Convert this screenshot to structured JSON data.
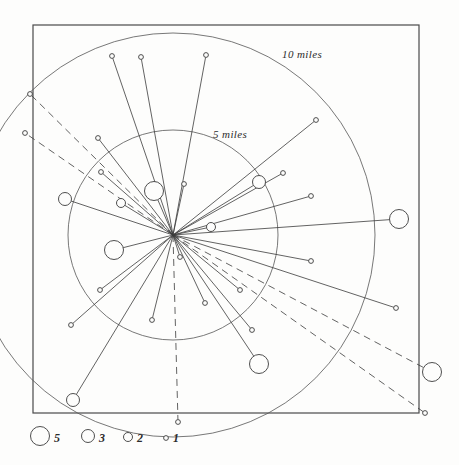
{
  "figure": {
    "background_color": "#fdfdfc",
    "ink_color": "#3b3b3b",
    "frame": {
      "x": 33,
      "y": 25,
      "width": 386,
      "height": 388
    }
  },
  "rings": [
    {
      "label": "5 miles",
      "radius_px": 105,
      "label_x": 213,
      "label_y": 138
    },
    {
      "label": "10 miles",
      "radius_px": 202,
      "label_x": 282,
      "label_y": 58
    }
  ],
  "legend": {
    "items": [
      {
        "value": "5",
        "radius_px": 9.5,
        "cx": 40,
        "cy": 436,
        "label_x": 54,
        "label_y": 442
      },
      {
        "value": "3",
        "radius_px": 6.5,
        "cx": 88,
        "cy": 436,
        "label_x": 99,
        "label_y": 442
      },
      {
        "value": "2",
        "radius_px": 4.5,
        "cx": 128,
        "cy": 437,
        "label_x": 137,
        "label_y": 442
      },
      {
        "value": "1",
        "radius_px": 2.4,
        "cx": 166,
        "cy": 438,
        "label_x": 173,
        "label_y": 442
      }
    ]
  },
  "chart_data": {
    "type": "scatter",
    "xlabel": "",
    "ylabel": "",
    "legend_position": "bottom-left",
    "center": {
      "x": 173,
      "y": 235,
      "label": "origin"
    },
    "scale": {
      "ring_radii_px": [
        105,
        202
      ],
      "ring_values_miles": [
        5,
        10
      ],
      "px_per_mile": 21
    },
    "size_encoding": {
      "unit": "count",
      "values": [
        5,
        3,
        2,
        1
      ],
      "radii_px": [
        9.5,
        6.5,
        4.5,
        2.4
      ]
    },
    "grid": false,
    "points": [
      {
        "x": 112,
        "y": 56,
        "count": 1,
        "style": "solid"
      },
      {
        "x": 141,
        "y": 57,
        "count": 1,
        "style": "solid"
      },
      {
        "x": 206,
        "y": 55,
        "count": 1,
        "style": "solid"
      },
      {
        "x": 30,
        "y": 94,
        "count": 1,
        "style": "dashed"
      },
      {
        "x": 25,
        "y": 133,
        "count": 1,
        "style": "dashed"
      },
      {
        "x": 98,
        "y": 138,
        "count": 1,
        "style": "solid"
      },
      {
        "x": 101,
        "y": 172,
        "count": 1,
        "style": "solid"
      },
      {
        "x": 154,
        "y": 191,
        "count": 5,
        "style": "solid"
      },
      {
        "x": 184,
        "y": 184,
        "count": 1,
        "style": "solid"
      },
      {
        "x": 316,
        "y": 120,
        "count": 1,
        "style": "solid"
      },
      {
        "x": 283,
        "y": 173,
        "count": 1,
        "style": "solid"
      },
      {
        "x": 259,
        "y": 182,
        "count": 3,
        "style": "solid"
      },
      {
        "x": 311,
        "y": 196,
        "count": 1,
        "style": "solid"
      },
      {
        "x": 65,
        "y": 199,
        "count": 3,
        "style": "solid"
      },
      {
        "x": 121,
        "y": 203,
        "count": 2,
        "style": "solid"
      },
      {
        "x": 211,
        "y": 227,
        "count": 2,
        "style": "solid"
      },
      {
        "x": 399,
        "y": 219,
        "count": 5,
        "style": "solid"
      },
      {
        "x": 114,
        "y": 250,
        "count": 5,
        "style": "solid"
      },
      {
        "x": 180,
        "y": 257,
        "count": 1,
        "style": "solid"
      },
      {
        "x": 311,
        "y": 261,
        "count": 1,
        "style": "solid"
      },
      {
        "x": 100,
        "y": 290,
        "count": 1,
        "style": "solid"
      },
      {
        "x": 205,
        "y": 303,
        "count": 1,
        "style": "solid"
      },
      {
        "x": 152,
        "y": 320,
        "count": 1,
        "style": "solid"
      },
      {
        "x": 71,
        "y": 325,
        "count": 1,
        "style": "solid"
      },
      {
        "x": 240,
        "y": 290,
        "count": 1,
        "style": "solid"
      },
      {
        "x": 252,
        "y": 330,
        "count": 1,
        "style": "solid"
      },
      {
        "x": 259,
        "y": 364,
        "count": 5,
        "style": "solid"
      },
      {
        "x": 396,
        "y": 308,
        "count": 1,
        "style": "solid"
      },
      {
        "x": 73,
        "y": 400,
        "count": 3,
        "style": "solid"
      },
      {
        "x": 178,
        "y": 422,
        "count": 1,
        "style": "dashed"
      },
      {
        "x": 432,
        "y": 372,
        "count": 5,
        "style": "dashed"
      },
      {
        "x": 425,
        "y": 413,
        "count": 1,
        "style": "dashed"
      }
    ]
  }
}
